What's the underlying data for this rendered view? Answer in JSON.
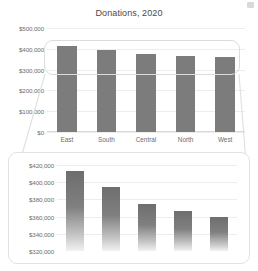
{
  "chart_data": [
    {
      "id": "overview",
      "type": "bar",
      "title": "Donations, 2020",
      "xlabel": "",
      "ylabel": "",
      "categories": [
        "East",
        "South",
        "Central",
        "North",
        "West"
      ],
      "values": [
        413000,
        394000,
        375000,
        367000,
        360000
      ],
      "ylim": [
        0,
        500000
      ],
      "yticks": [
        0,
        100000,
        200000,
        300000,
        400000,
        500000
      ],
      "ytick_labels": [
        "$0",
        "$100,000",
        "$200,000",
        "$300,000",
        "$400,000",
        "$500,000"
      ],
      "grid": true,
      "legend": "none",
      "bar_color": "#7c7c7c"
    },
    {
      "id": "zoomed",
      "type": "bar",
      "title": "",
      "xlabel": "",
      "ylabel": "",
      "categories": [
        "East",
        "South",
        "Central",
        "North",
        "West"
      ],
      "values": [
        413000,
        394000,
        375000,
        367000,
        360000
      ],
      "ylim": [
        320000,
        420000
      ],
      "yticks": [
        320000,
        340000,
        360000,
        380000,
        400000,
        420000
      ],
      "ytick_labels": [
        "$320,000",
        "$340,000",
        "$360,000",
        "$380,000",
        "$400,000",
        "$420,000"
      ],
      "grid": true,
      "legend": "none",
      "bar_color": "#7c7c7c"
    }
  ],
  "annotations": {
    "callout_label": "zoom-highlight-region",
    "connector_label": "zoom-connector-lines"
  }
}
